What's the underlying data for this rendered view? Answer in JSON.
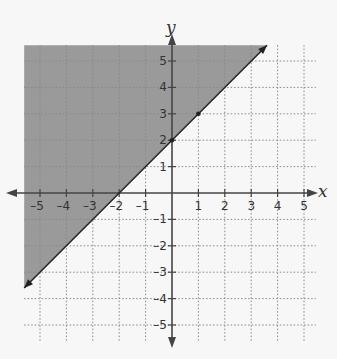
{
  "chart_data": {
    "type": "line",
    "title": "",
    "subtitle": "",
    "xlabel": "x",
    "ylabel": "y",
    "xlim": [
      -5.6,
      5.6
    ],
    "ylim": [
      -5.6,
      5.6
    ],
    "grid": true,
    "grid_style": "dotted",
    "x_ticks": [
      -5,
      -4,
      -3,
      -2,
      -1,
      1,
      2,
      3,
      4,
      5
    ],
    "y_ticks": [
      -5,
      -4,
      -3,
      -2,
      -1,
      1,
      2,
      3,
      4,
      5
    ],
    "x_tick_labels": [
      "–5",
      "–4",
      "–3",
      "–2",
      "–1",
      "1",
      "2",
      "3",
      "4",
      "5"
    ],
    "y_tick_labels": [
      "–5",
      "–4",
      "–3",
      "–2",
      "–1",
      "1",
      "2",
      "3",
      "4",
      "5"
    ],
    "series": [
      {
        "name": "boundary line y = x + 2",
        "equation": "y = x + 2",
        "style": "solid",
        "arrows": "both ends",
        "x": [
          -5.6,
          3.6
        ],
        "y": [
          -3.6,
          5.6
        ],
        "marked_points": [
          [
            0,
            2
          ],
          [
            1,
            3
          ]
        ]
      }
    ],
    "shaded_region": {
      "description": "region above the line (y ≥ x + 2)",
      "inequality": "y ≥ x + 2",
      "polygon": [
        [
          -5.6,
          5.6
        ],
        [
          3.6,
          5.6
        ],
        [
          -5.6,
          -3.6
        ]
      ],
      "color": "#9a9a9a"
    },
    "legend": null
  },
  "labels": {
    "x_axis": "x",
    "y_axis": "y"
  },
  "colors": {
    "background": "#f7f7f7",
    "shade": "#9a9a9a",
    "axis": "#444444",
    "grid": "#888888",
    "line": "#222222"
  }
}
